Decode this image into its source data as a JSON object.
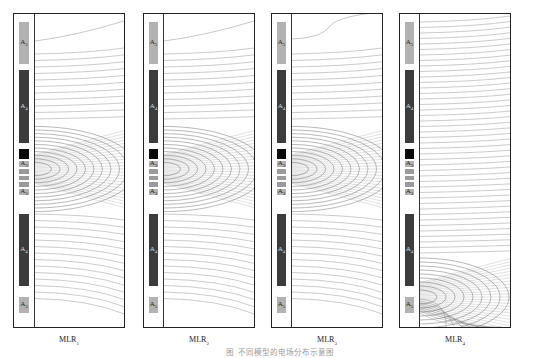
{
  "figure": {
    "caption": "图 不同模型的电场分布示意图",
    "panels": [
      {
        "id": "mlr1",
        "label_main": "MLR",
        "label_sub": "1",
        "current_source": "center"
      },
      {
        "id": "mlr2",
        "label_main": "MLR",
        "label_sub": "2",
        "current_source": "center"
      },
      {
        "id": "mlr3",
        "label_main": "MLR",
        "label_sub": "3",
        "current_source": "center"
      },
      {
        "id": "mlr4",
        "label_main": "MLR",
        "label_sub": "4",
        "current_source": "bottom"
      }
    ],
    "layers": [
      {
        "name": "A",
        "sub": "5",
        "style": "light",
        "top": 0,
        "height": 42,
        "labeled": true
      },
      {
        "name": "A",
        "sub": "4",
        "style": "dark",
        "top": 48,
        "height": 73,
        "labeled": true
      },
      {
        "name": "",
        "sub": "",
        "style": "black",
        "top": 127,
        "height": 10,
        "labeled": false
      },
      {
        "name": "A",
        "sub": "3",
        "style": "light",
        "top": 139,
        "height": 6,
        "labeled": true
      },
      {
        "name": "A",
        "sub": "2",
        "style": "thin",
        "top": 147,
        "height": 5,
        "labeled": true
      },
      {
        "name": "A",
        "sub": "1",
        "style": "thin",
        "top": 154,
        "height": 4,
        "labeled": true
      },
      {
        "name": "A",
        "sub": "2",
        "style": "thin",
        "top": 160,
        "height": 5,
        "labeled": true
      },
      {
        "name": "A",
        "sub": "3",
        "style": "light",
        "top": 167,
        "height": 6,
        "labeled": true
      },
      {
        "name": "A",
        "sub": "4",
        "style": "dark",
        "top": 192,
        "height": 72,
        "labeled": true
      },
      {
        "name": "A",
        "sub": "5",
        "style": "light",
        "top": 275,
        "height": 16,
        "labeled": true
      }
    ],
    "colors": {
      "border": "#222222",
      "light_layer": "#b2b2b2",
      "dark_layer": "#3c3c3c",
      "black_layer": "#0a0a0a",
      "contour": "#555555"
    }
  }
}
